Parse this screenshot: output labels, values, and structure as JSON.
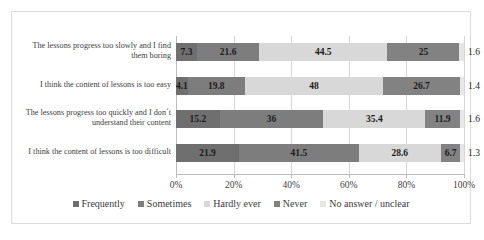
{
  "chart_data": {
    "type": "bar",
    "orientation": "horizontal",
    "stacked": true,
    "stack_mode": "percent",
    "title": "",
    "subtitle": "",
    "xlabel": "",
    "ylabel": "",
    "xlim": [
      0,
      100
    ],
    "xticks": [
      "0%",
      "20%",
      "40%",
      "60%",
      "80%",
      "100%"
    ],
    "xtick_values": [
      0,
      20,
      40,
      60,
      80,
      100
    ],
    "grid": true,
    "grid_axis": "x",
    "legend_position": "bottom",
    "categories": [
      "The lessons progress too slowly and I find them boring",
      "I think the content of lessons is too easy",
      "The lessons progress too quickly and I don´t understand their content",
      "I think the content of lessons is too difficult"
    ],
    "series": [
      {
        "name": "Frequently",
        "color": "#6f6f6f",
        "values": [
          7.3,
          4.1,
          15.2,
          21.9
        ]
      },
      {
        "name": "Sometimes",
        "color": "#7d7d7d",
        "values": [
          21.6,
          19.8,
          36,
          41.5
        ]
      },
      {
        "name": "Hardly ever",
        "color": "#d8d8d8",
        "values": [
          44.5,
          48,
          35.4,
          28.6
        ]
      },
      {
        "name": "Never",
        "color": "#828282",
        "values": [
          25,
          26.7,
          11.9,
          6.7
        ]
      },
      {
        "name": "No answer / unclear",
        "color": "#e6e6e6",
        "values": [
          1.6,
          1.4,
          1.6,
          1.3
        ]
      }
    ],
    "value_labels": [
      [
        "7.3",
        "21.6",
        "44.5",
        "25",
        "1.6"
      ],
      [
        "4.1",
        "19.8",
        "48",
        "26.7",
        "1.4"
      ],
      [
        "15.2",
        "36",
        "35.4",
        "11.9",
        "1.6"
      ],
      [
        "21.9",
        "41.5",
        "28.6",
        "6.7",
        "1.3"
      ]
    ]
  },
  "legend": {
    "items": [
      {
        "label": "Frequently"
      },
      {
        "label": "Sometimes"
      },
      {
        "label": "Hardly ever"
      },
      {
        "label": "Never"
      },
      {
        "label": "No answer / unclear"
      }
    ]
  }
}
